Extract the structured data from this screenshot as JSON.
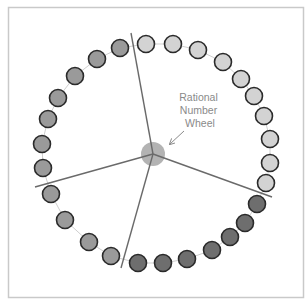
{
  "diagram": {
    "title_lines": [
      "Rational",
      "Number",
      "Wheel"
    ],
    "frame": {
      "x": 8.5,
      "y": 7.5,
      "width": 295,
      "height": 290,
      "stroke": "#c9c9c9"
    },
    "colors": {
      "light": "#d3d3d3",
      "medium": "#9a9a9a",
      "dark": "#6e6e6e",
      "circle_stroke": "#2a2a2a",
      "connector": "#cfcfcf",
      "spoke": "#6a6a6a",
      "hub": "#b3b3b3",
      "label": "#8a8a8a",
      "arrow": "#8a8a8a"
    },
    "hub": {
      "cx": 153,
      "cy": 154,
      "r": 12
    },
    "spokes": [
      {
        "name": "spoke-up",
        "x2": 131,
        "y2": 33
      },
      {
        "name": "spoke-left",
        "x2": 35,
        "y2": 187
      },
      {
        "name": "spoke-down",
        "x2": 121,
        "y2": 268
      },
      {
        "name": "spoke-right",
        "x2": 272,
        "y2": 197
      }
    ],
    "circle_radius": 8.5,
    "circles": [
      {
        "x": 146,
        "y": 44,
        "tone": "light"
      },
      {
        "x": 173,
        "y": 44,
        "tone": "light"
      },
      {
        "x": 198,
        "y": 50,
        "tone": "light"
      },
      {
        "x": 223,
        "y": 62,
        "tone": "light"
      },
      {
        "x": 241,
        "y": 79,
        "tone": "light"
      },
      {
        "x": 254,
        "y": 96,
        "tone": "light"
      },
      {
        "x": 264,
        "y": 116,
        "tone": "light"
      },
      {
        "x": 270,
        "y": 139,
        "tone": "light"
      },
      {
        "x": 270,
        "y": 163,
        "tone": "light"
      },
      {
        "x": 266,
        "y": 183,
        "tone": "light"
      },
      {
        "x": 257,
        "y": 204,
        "tone": "dark"
      },
      {
        "x": 245,
        "y": 223,
        "tone": "dark"
      },
      {
        "x": 230,
        "y": 237,
        "tone": "dark"
      },
      {
        "x": 212,
        "y": 250,
        "tone": "dark"
      },
      {
        "x": 187,
        "y": 259,
        "tone": "dark"
      },
      {
        "x": 163,
        "y": 263,
        "tone": "dark"
      },
      {
        "x": 138,
        "y": 263,
        "tone": "dark"
      },
      {
        "x": 111,
        "y": 256,
        "tone": "medium"
      },
      {
        "x": 89,
        "y": 242,
        "tone": "medium"
      },
      {
        "x": 65,
        "y": 220,
        "tone": "medium"
      },
      {
        "x": 51,
        "y": 194,
        "tone": "medium"
      },
      {
        "x": 43,
        "y": 168,
        "tone": "medium"
      },
      {
        "x": 42,
        "y": 144,
        "tone": "medium"
      },
      {
        "x": 48,
        "y": 119,
        "tone": "medium"
      },
      {
        "x": 58,
        "y": 98,
        "tone": "medium"
      },
      {
        "x": 75,
        "y": 76,
        "tone": "medium"
      },
      {
        "x": 97,
        "y": 59,
        "tone": "medium"
      },
      {
        "x": 120,
        "y": 48,
        "tone": "medium"
      }
    ],
    "label": {
      "x": 200,
      "y_start": 101,
      "line_height": 13
    },
    "arrow": {
      "x1": 184,
      "y1": 131,
      "x2": 170,
      "y2": 144
    }
  }
}
